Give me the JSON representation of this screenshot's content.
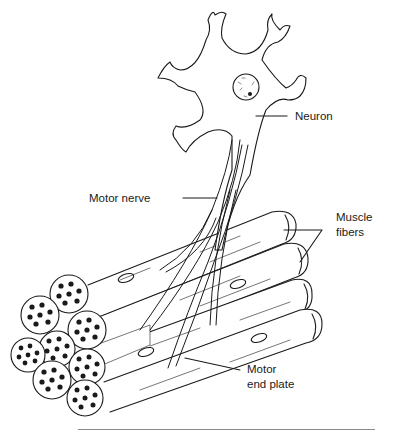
{
  "diagram": {
    "type": "anatomical illustration",
    "labels": {
      "neuron": "Neuron",
      "motor_nerve": "Motor nerve",
      "muscle_fibers_line1": "Muscle",
      "muscle_fibers_line2": "fibers",
      "motor_end_plate_line1": "Motor",
      "motor_end_plate_line2": "end plate"
    },
    "colors": {
      "ink": "#1a1a1a",
      "background": "#ffffff",
      "rule": "#8a8a8a"
    }
  }
}
